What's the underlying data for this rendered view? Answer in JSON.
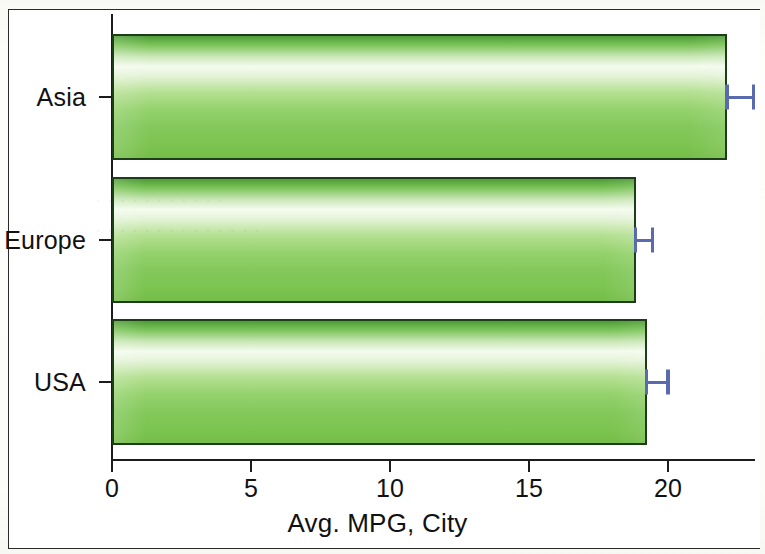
{
  "chart_data": {
    "type": "bar",
    "orientation": "horizontal",
    "title": "",
    "xlabel": "Avg. MPG, City",
    "ylabel": "",
    "categories": [
      "Asia",
      "Europe",
      "USA"
    ],
    "values": [
      22.1,
      18.8,
      19.2
    ],
    "errors": [
      0.95,
      0.62,
      0.78
    ],
    "error_type": "error-bar-upper",
    "xlim": [
      0,
      23.1
    ],
    "xticks": [
      0,
      5,
      10,
      15,
      20
    ],
    "xtick_labels": [
      "0",
      "5",
      "10",
      "15",
      "20"
    ],
    "grid": false,
    "legend": false,
    "series": [
      {
        "name": "Avg. MPG, City",
        "values": [
          22.1,
          18.8,
          19.2
        ]
      }
    ],
    "colors": {
      "bar_fill_light": "#f4fbef",
      "bar_fill_mid": "#95d26d",
      "bar_fill_dark": "#4e9b38",
      "bar_border": "#1d3d18",
      "error_bar": "#5a6ab0",
      "axis": "#1c1c1c",
      "background": "#ffffff",
      "frame_border": "#2a2a2a"
    }
  }
}
